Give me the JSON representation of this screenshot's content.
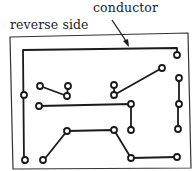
{
  "labels": {
    "conductor": "conductor",
    "reverse_side": "reverse side"
  },
  "colors": {
    "ink": "#1a1a1a",
    "board_outline": "#333333",
    "background": "#ffffff"
  }
}
